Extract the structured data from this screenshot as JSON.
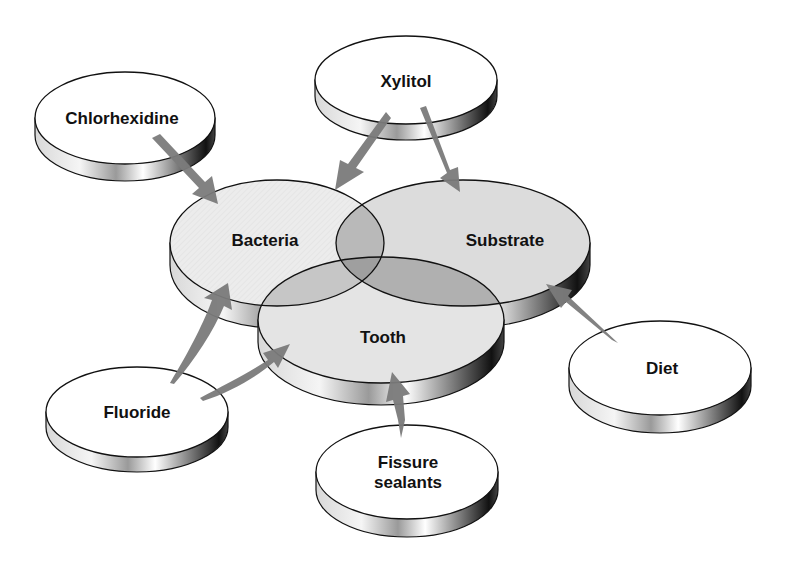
{
  "diagram": {
    "type": "venn-with-influences",
    "core": [
      {
        "id": "bacteria",
        "label": "Bacteria"
      },
      {
        "id": "substrate",
        "label": "Substrate"
      },
      {
        "id": "tooth",
        "label": "Tooth"
      }
    ],
    "factors": [
      {
        "id": "chlorhexidine",
        "label": "Chlorhexidine",
        "targets": [
          "bacteria"
        ]
      },
      {
        "id": "xylitol",
        "label": "Xylitol",
        "targets": [
          "bacteria",
          "substrate"
        ]
      },
      {
        "id": "diet",
        "label": "Diet",
        "targets": [
          "substrate"
        ]
      },
      {
        "id": "fluoride",
        "label": "Fluoride",
        "targets": [
          "bacteria",
          "tooth"
        ]
      },
      {
        "id": "fissure_sealants",
        "label_line1": "Fissure",
        "label_line2": "sealants",
        "targets": [
          "tooth"
        ]
      }
    ],
    "colors": {
      "disc_top": "#ffffff",
      "core_fill": "#e9e9e9",
      "overlap_two": "#c4c4c4",
      "overlap_three": "#a9a9a9",
      "arrow": "#7b7b7b",
      "outline": "#111111"
    }
  }
}
